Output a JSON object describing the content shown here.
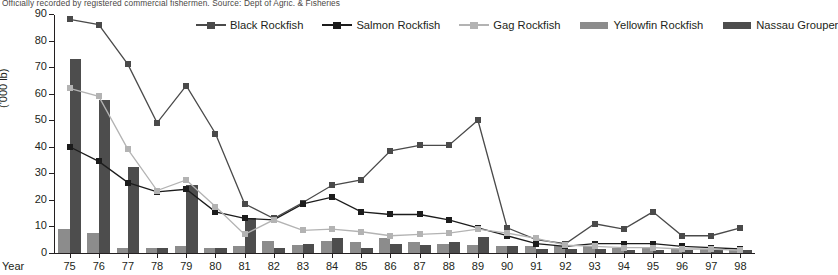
{
  "subtitle": "Officially recorded by registered commercial fishermen. Source: Dept of Agric. & Fisheries",
  "axes": {
    "y_title": "('000 lb)",
    "x_title": "Year"
  },
  "colors": {
    "black_rockfish": "#4a4a4a",
    "salmon_rockfish": "#1c1c1c",
    "gag_rockfish": "#b3b3b3",
    "yellowfin_rockfish": "#8c8c8c",
    "nassau_grouper": "#4d4d4d",
    "axis": "#231f20",
    "subtitle": "#4b4745"
  },
  "legend": {
    "items": [
      {
        "label": "Black Rockfish",
        "key": "line",
        "color": "#4a4a4a"
      },
      {
        "label": "Salmon Rockfish",
        "key": "line",
        "color": "#1c1c1c"
      },
      {
        "label": "Gag Rockfish",
        "key": "line",
        "color": "#b3b3b3"
      },
      {
        "label": "Yellowfin Rockfish",
        "key": "bar",
        "color": "#8c8c8c"
      },
      {
        "label": "Nassau Grouper",
        "key": "bar",
        "color": "#4d4d4d"
      }
    ]
  },
  "chart_data": {
    "type": "bar",
    "title": "",
    "subtitle": "Officially recorded by registered commercial fishermen. Source: Dept of Agric. & Fisheries",
    "xlabel": "Year",
    "ylabel": "('000 lb)",
    "ylim": [
      0,
      90
    ],
    "ytick_labels": [
      "0",
      "10",
      "20",
      "30",
      "40",
      "50",
      "60",
      "70",
      "80",
      "90"
    ],
    "yticks": [
      0,
      10,
      20,
      30,
      40,
      50,
      60,
      70,
      80,
      90
    ],
    "grid": false,
    "legend_position": "top",
    "categories": [
      "75",
      "76",
      "77",
      "78",
      "79",
      "80",
      "81",
      "82",
      "83",
      "84",
      "85",
      "86",
      "87",
      "88",
      "89",
      "90",
      "91",
      "92",
      "93",
      "94",
      "95",
      "96",
      "97",
      "98"
    ],
    "series": [
      {
        "name": "Black Rockfish",
        "type": "line",
        "color": "#4a4a4a",
        "values": [
          88,
          86,
          71,
          49,
          63,
          45,
          18.5,
          13,
          19,
          25.5,
          27.5,
          38.5,
          40.5,
          40.5,
          50,
          9.5,
          5,
          3.5,
          11,
          9,
          15.5,
          6.5,
          6.5,
          9.5
        ]
      },
      {
        "name": "Salmon Rockfish",
        "type": "line",
        "color": "#1c1c1c",
        "values": [
          40,
          34.5,
          26.5,
          23,
          24,
          15.5,
          13,
          12.5,
          18.5,
          21,
          15.5,
          14.5,
          14.5,
          12.5,
          9.5,
          6.5,
          3.5,
          2.5,
          3.5,
          3.5,
          3.5,
          2.5,
          2,
          1.5
        ]
      },
      {
        "name": "Gag Rockfish",
        "type": "line",
        "color": "#b3b3b3",
        "values": [
          62,
          59,
          39,
          23.5,
          27.5,
          17.5,
          7,
          12.5,
          8.5,
          9,
          8,
          6.5,
          7,
          7.5,
          9,
          7.5,
          5.5,
          3,
          2.5,
          2,
          2,
          1.5,
          1.5,
          1
        ]
      },
      {
        "name": "Yellowfin Rockfish",
        "type": "bar",
        "color": "#8c8c8c",
        "values": [
          9,
          7.5,
          2,
          2,
          2.5,
          2,
          2.5,
          4.5,
          3,
          4.5,
          4,
          5.5,
          4,
          3.5,
          3,
          2.5,
          2.5,
          2.5,
          2.5,
          2,
          2,
          1.5,
          1.5,
          1
        ]
      },
      {
        "name": "Nassau Grouper",
        "type": "bar",
        "color": "#4d4d4d",
        "values": [
          73,
          57.5,
          32.5,
          2,
          25.5,
          2,
          13,
          2,
          3.5,
          5.5,
          2,
          3.5,
          3,
          4,
          6,
          2.5,
          1.5,
          1.5,
          1.5,
          1,
          1,
          1,
          1,
          1
        ]
      }
    ]
  }
}
